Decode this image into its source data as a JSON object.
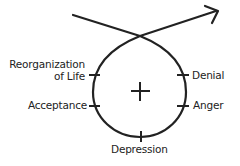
{
  "diagram": {
    "center_symbol": "+",
    "stages": {
      "denial": "Denial",
      "anger": "Anger",
      "depression": "Depression",
      "acceptance": "Acceptance",
      "reorganization_line1": "Reorganization",
      "reorganization_line2": "of Life"
    },
    "stroke_color": "#222222"
  }
}
